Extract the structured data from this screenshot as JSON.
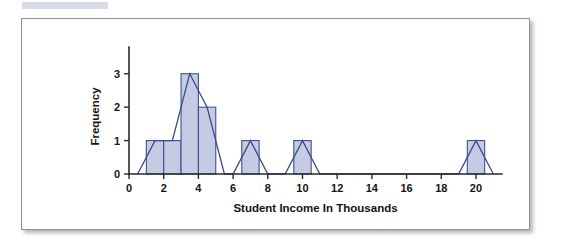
{
  "page": {
    "background_color": "#ffffff",
    "tab_strip_color": "#c9cfdd"
  },
  "figure": {
    "card_border_color": "#8d8f99",
    "card_background": "#ffffff"
  },
  "chart_data": {
    "type": "bar",
    "title": "",
    "subtitle": "",
    "xlabel": "Student Income In Thousands",
    "ylabel": "Frequency",
    "xlim": [
      0,
      21.5
    ],
    "ylim": [
      0,
      3.8
    ],
    "grid": false,
    "legend": null,
    "bar_fill_color": "#c5cbe3",
    "bar_edge_color": "#3f4f90",
    "polygon_line_color": "#3b4a8c",
    "xticks": [
      0,
      2,
      4,
      6,
      8,
      10,
      12,
      14,
      16,
      18,
      20
    ],
    "xtick_labels": [
      "0",
      "2",
      "4",
      "6",
      "8",
      "10",
      "12",
      "14",
      "16",
      "18",
      "20"
    ],
    "yticks": [
      0,
      1,
      2,
      3
    ],
    "ytick_labels": [
      "0",
      "1",
      "2",
      "3"
    ],
    "bin_width": 1,
    "bins": [
      {
        "left": 1.0,
        "right": 2.0,
        "center": 1.5,
        "value": 1
      },
      {
        "left": 2.0,
        "right": 3.0,
        "center": 2.5,
        "value": 1
      },
      {
        "left": 3.0,
        "right": 4.0,
        "center": 3.5,
        "value": 3
      },
      {
        "left": 4.0,
        "right": 5.0,
        "center": 4.5,
        "value": 2
      },
      {
        "left": 6.5,
        "right": 7.5,
        "center": 7.0,
        "value": 1
      },
      {
        "left": 9.5,
        "right": 10.5,
        "center": 10.0,
        "value": 1
      },
      {
        "left": 19.5,
        "right": 20.5,
        "center": 20.0,
        "value": 1
      }
    ],
    "polygon_points": [
      {
        "x": 0.5,
        "y": 0
      },
      {
        "x": 1.5,
        "y": 1
      },
      {
        "x": 2.5,
        "y": 1
      },
      {
        "x": 3.5,
        "y": 3
      },
      {
        "x": 4.5,
        "y": 2
      },
      {
        "x": 5.5,
        "y": 0
      },
      {
        "x": 6.0,
        "y": 0
      },
      {
        "x": 7.0,
        "y": 1
      },
      {
        "x": 8.0,
        "y": 0
      },
      {
        "x": 9.0,
        "y": 0
      },
      {
        "x": 10.0,
        "y": 1
      },
      {
        "x": 11.0,
        "y": 0
      },
      {
        "x": 19.0,
        "y": 0
      },
      {
        "x": 20.0,
        "y": 1
      },
      {
        "x": 21.0,
        "y": 0
      }
    ],
    "categories": [
      "1-2",
      "2-3",
      "3-4",
      "4-5",
      "6.5-7.5",
      "9.5-10.5",
      "19.5-20.5"
    ],
    "values": [
      1,
      1,
      3,
      2,
      1,
      1,
      1
    ]
  }
}
